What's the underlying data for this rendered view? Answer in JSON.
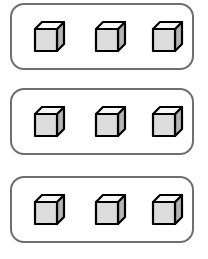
{
  "scene": {
    "width": 208,
    "height": 259,
    "background_color": "#ffffff",
    "description": "three-groups-of-three-cubes"
  },
  "style": {
    "group_border_color": "#6e6e6e",
    "group_border_width": 2.6,
    "group_corner_radius": 14,
    "group_fill_color": "#ffffff",
    "cube_outline_color": "#000000",
    "cube_front_face_color": "#dcdcdc",
    "cube_top_face_color": "#f7f7f7",
    "cube_side_face_color": "#b4b4b4",
    "cube_outline_width": 2.2
  },
  "geometry": {
    "group_left": 10,
    "group_width": 184,
    "group_height": 67,
    "group_tops": [
      3,
      88,
      176
    ],
    "cube_lefts": [
      22,
      83,
      140
    ],
    "cube_front_size": 22,
    "cube_depth": 7,
    "cube_block_width": 29,
    "cube_block_height": 29
  },
  "groups": [
    {
      "id": "group-1",
      "label": "Group 1",
      "count": 3,
      "items": [
        {
          "id": "cube-1-1",
          "label": "Cube"
        },
        {
          "id": "cube-1-2",
          "label": "Cube"
        },
        {
          "id": "cube-1-3",
          "label": "Cube"
        }
      ]
    },
    {
      "id": "group-2",
      "label": "Group 2",
      "count": 3,
      "items": [
        {
          "id": "cube-2-1",
          "label": "Cube"
        },
        {
          "id": "cube-2-2",
          "label": "Cube"
        },
        {
          "id": "cube-2-3",
          "label": "Cube"
        }
      ]
    },
    {
      "id": "group-3",
      "label": "Group 3",
      "count": 3,
      "items": [
        {
          "id": "cube-3-1",
          "label": "Cube"
        },
        {
          "id": "cube-3-2",
          "label": "Cube"
        },
        {
          "id": "cube-3-3",
          "label": "Cube"
        }
      ]
    }
  ],
  "totals": {
    "group_count": 3,
    "cubes_per_group": 3,
    "total_cubes": 9
  }
}
